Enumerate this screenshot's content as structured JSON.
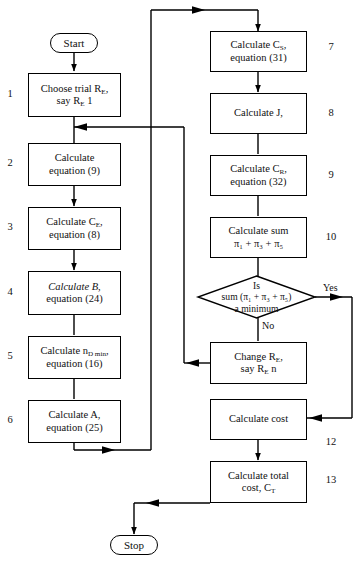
{
  "diagram": {
    "type": "flowchart",
    "terminals": {
      "start": "Start",
      "stop": "Stop"
    },
    "edge_labels": {
      "yes": "Yes",
      "no": "No"
    },
    "steps": [
      {
        "number": "1",
        "line1": "Choose trial R",
        "sub1": "E",
        "tail1": ",",
        "line2": "say R",
        "sub2": "E",
        "tail2": " 1"
      },
      {
        "number": "2",
        "line1": "Calculate",
        "line2": "equation (9)"
      },
      {
        "number": "3",
        "line1": "Calculate C",
        "sub1": "E",
        "tail1": ",",
        "line2": "equation (8)"
      },
      {
        "number": "4",
        "line1": "Calculate B,",
        "line2": "equation (24)"
      },
      {
        "number": "5",
        "line1": "Calculate n",
        "sub1": "D min",
        "tail1": ",",
        "line2": "equation (16)"
      },
      {
        "number": "6",
        "line1": "Calculate A,",
        "line2": "equation (25)"
      },
      {
        "number": "7",
        "line1": "Calculate C",
        "sub1": "S",
        "tail1": ",",
        "line2": "equation (31)"
      },
      {
        "number": "8",
        "line1": "Calculate J,"
      },
      {
        "number": "9",
        "line1": "Calculate C",
        "sub1": "R",
        "tail1": ",",
        "line2": "equation (32)"
      },
      {
        "number": "10",
        "line1": "Calculate sum",
        "line2": "π₁ + π₃ + π₅"
      },
      {
        "number": "11",
        "line1": "Is",
        "line2": "sum (π₁ + π₃ + π₅)",
        "line3": "a minimum"
      },
      {
        "number": "",
        "line1": "Change R",
        "sub1": "E",
        "tail1": ",",
        "line2": "say R",
        "sub2": "E",
        "tail2": " n"
      },
      {
        "number": "12",
        "line1": "Calculate cost"
      },
      {
        "number": "13",
        "line1": "Calculate total",
        "line2": "cost, C",
        "sub2": "T"
      }
    ],
    "numbers": [
      "1",
      "2",
      "3",
      "4",
      "5",
      "6",
      "7",
      "8",
      "9",
      "10",
      "12",
      "13"
    ],
    "colors": {
      "line": "#000000",
      "background": "#ffffff",
      "text": "#111111"
    }
  }
}
